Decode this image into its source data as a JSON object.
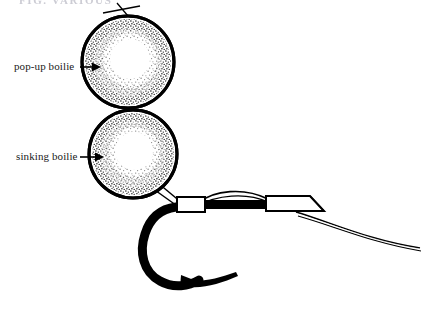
{
  "figure": {
    "header_caption": "FIG. VARIOUS",
    "background_color": "#ffffff",
    "ink_color": "#000000"
  },
  "labels": [
    {
      "id": "pop-up-boilie",
      "text": "pop-up boilie",
      "arrow": "right-arrow",
      "points_to": "upper-boilie"
    },
    {
      "id": "sinking-boilie",
      "text": "sinking boilie",
      "arrow": "right-arrow",
      "points_to": "lower-boilie"
    }
  ],
  "parts": {
    "upper_boilie": {
      "name": "pop-up boilie",
      "shape": "circle",
      "center_x": 128,
      "center_y": 62,
      "radius": 46,
      "fill": "stippled-ring",
      "outline_width": 3
    },
    "lower_boilie": {
      "name": "sinking boilie",
      "shape": "circle",
      "center_x": 133,
      "center_y": 154,
      "radius": 44,
      "fill": "stippled-ring",
      "outline_width": 3
    },
    "hair_stop": {
      "name": "bait-stop-hair",
      "location": "top of upper boilie"
    },
    "connector_stem": {
      "name": "hair-between-boilies",
      "from": "upper-boilie-bottom",
      "to": "lower-boilie-top"
    },
    "hook": {
      "name": "fishing-hook",
      "shape": "j-curve",
      "has_barb": true,
      "line_width": 9
    },
    "shrink_tube_left": {
      "name": "left-sleeve",
      "shape": "rectangle",
      "fill": "#ffffff"
    },
    "shrink_tube_right": {
      "name": "right-sleeve",
      "shape": "tapered-rectangle",
      "fill": "#ffffff"
    },
    "shank_section": {
      "name": "black-shank-section",
      "fill": "#000000"
    },
    "line_loop": {
      "name": "arched-line-loop",
      "description": "thin line arching above shank"
    },
    "trailing_line": {
      "name": "trailing-mainline",
      "description": "two thin lines curving off to the right"
    }
  }
}
